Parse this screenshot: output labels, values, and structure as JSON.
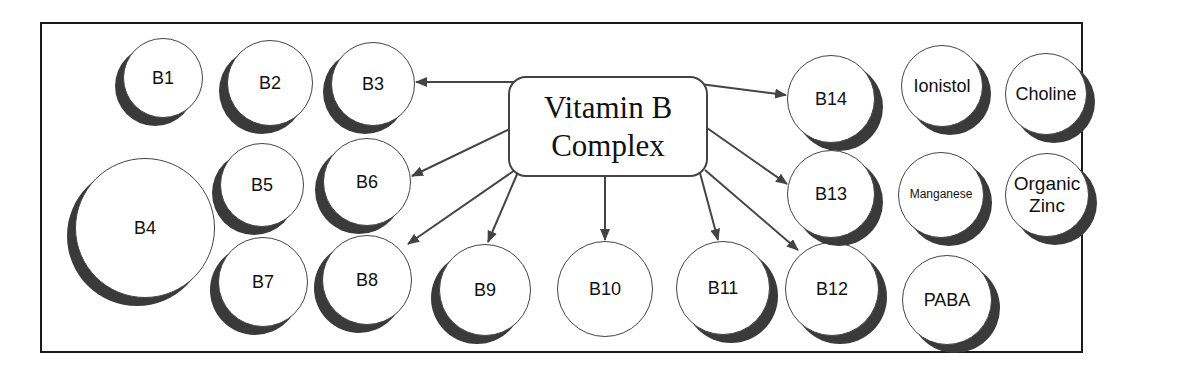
{
  "diagram": {
    "center": {
      "line1": "Vitamin B",
      "line2": "Complex"
    },
    "nodes": [
      {
        "id": "b1",
        "label": "B1",
        "cx": 163,
        "cy": 78,
        "r": 40,
        "shadow": "left"
      },
      {
        "id": "b2",
        "label": "B2",
        "cx": 270,
        "cy": 83,
        "r": 43,
        "shadow": "left"
      },
      {
        "id": "b3",
        "label": "B3",
        "cx": 373,
        "cy": 84,
        "r": 42,
        "shadow": "left"
      },
      {
        "id": "b4",
        "label": "B4",
        "cx": 145,
        "cy": 228,
        "r": 70,
        "shadow": "left"
      },
      {
        "id": "b5",
        "label": "B5",
        "cx": 262,
        "cy": 185,
        "r": 42,
        "shadow": "left"
      },
      {
        "id": "b6",
        "label": "B6",
        "cx": 367,
        "cy": 182,
        "r": 44,
        "shadow": "left"
      },
      {
        "id": "b7",
        "label": "B7",
        "cx": 263,
        "cy": 282,
        "r": 45,
        "shadow": "left"
      },
      {
        "id": "b8",
        "label": "B8",
        "cx": 367,
        "cy": 280,
        "r": 45,
        "shadow": "left"
      },
      {
        "id": "b9",
        "label": "B9",
        "cx": 485,
        "cy": 290,
        "r": 46,
        "shadow": "left"
      },
      {
        "id": "b10",
        "label": "B10",
        "cx": 605,
        "cy": 289,
        "r": 48,
        "shadow": "none"
      },
      {
        "id": "b11",
        "label": "B11",
        "cx": 723,
        "cy": 288,
        "r": 47,
        "shadow": "right"
      },
      {
        "id": "b12",
        "label": "B12",
        "cx": 832,
        "cy": 289,
        "r": 47,
        "shadow": "right"
      },
      {
        "id": "paba",
        "label": "PABA",
        "cx": 947,
        "cy": 300,
        "r": 45,
        "shadow": "right"
      },
      {
        "id": "b14",
        "label": "B14",
        "cx": 831,
        "cy": 99,
        "r": 44,
        "shadow": "right"
      },
      {
        "id": "ionistol",
        "label": "Ionistol",
        "cx": 942,
        "cy": 86,
        "r": 41,
        "shadow": "right"
      },
      {
        "id": "choline",
        "label": "Choline",
        "cx": 1046,
        "cy": 94,
        "r": 41,
        "shadow": "right"
      },
      {
        "id": "b13",
        "label": "B13",
        "cx": 831,
        "cy": 194,
        "r": 44,
        "shadow": "right"
      },
      {
        "id": "manganese",
        "label": "Manganese",
        "cx": 941,
        "cy": 195,
        "r": 43,
        "shadow": "right",
        "small": true
      },
      {
        "id": "organic-zinc",
        "label": "Organic Zinc",
        "cx": 1047,
        "cy": 195,
        "r": 42,
        "shadow": "right"
      }
    ],
    "arrows": [
      {
        "to": "b3",
        "x1": 515,
        "y1": 82,
        "x2": 416,
        "y2": 82
      },
      {
        "to": "b14",
        "x1": 700,
        "y1": 84,
        "x2": 786,
        "y2": 95
      },
      {
        "to": "b6",
        "x1": 512,
        "y1": 128,
        "x2": 412,
        "y2": 176
      },
      {
        "to": "b13",
        "x1": 707,
        "y1": 128,
        "x2": 787,
        "y2": 184
      },
      {
        "to": "b8",
        "x1": 515,
        "y1": 170,
        "x2": 408,
        "y2": 244
      },
      {
        "to": "b9",
        "x1": 518,
        "y1": 172,
        "x2": 488,
        "y2": 242
      },
      {
        "to": "b10",
        "x1": 605,
        "y1": 177,
        "x2": 605,
        "y2": 240
      },
      {
        "to": "b11",
        "x1": 700,
        "y1": 173,
        "x2": 718,
        "y2": 240
      },
      {
        "to": "b12",
        "x1": 705,
        "y1": 170,
        "x2": 798,
        "y2": 250
      }
    ],
    "colors": {
      "stroke": "#444444",
      "shadow": "#3a3a3a",
      "frame": "#1a1a1a"
    }
  }
}
